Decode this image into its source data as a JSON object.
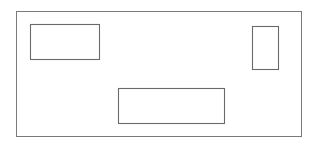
{
  "canvas": {
    "width": 316,
    "height": 148,
    "background_color": "#ffffff",
    "title": "Rectangle layout diagram"
  },
  "diagram_data": {
    "type": "diagram",
    "description": "Line drawing of a large outer rectangle containing three smaller empty rectangles",
    "stroke_color": "#6e6e6e",
    "fill_color": "#ffffff",
    "stroke_width": 1,
    "shapes": [
      {
        "name": "outer-frame",
        "role": "container",
        "x": 16,
        "y": 11,
        "width": 285,
        "height": 125,
        "stroke_color": "#7a7a7a",
        "fill_color": "#ffffff",
        "label": ""
      },
      {
        "name": "rect-top-left",
        "role": "child",
        "x": 30,
        "y": 24,
        "width": 69,
        "height": 35,
        "stroke_color": "#6a6a6a",
        "fill_color": "#ffffff",
        "label": ""
      },
      {
        "name": "rect-top-right",
        "role": "child",
        "x": 252,
        "y": 26,
        "width": 26,
        "height": 43,
        "stroke_color": "#6a6a6a",
        "fill_color": "#ffffff",
        "label": ""
      },
      {
        "name": "rect-bottom-center",
        "role": "child",
        "x": 118,
        "y": 88,
        "width": 106,
        "height": 35,
        "stroke_color": "#6a6a6a",
        "fill_color": "#ffffff",
        "label": ""
      }
    ]
  }
}
